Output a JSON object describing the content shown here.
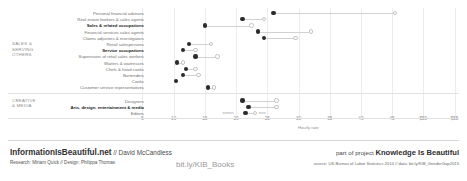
{
  "chart_data": {
    "type": "scatter",
    "subtype": "dumbbell",
    "title": "",
    "xlabel": "Hourly rate",
    "ylabel": "",
    "xlim": [
      3,
      57
    ],
    "grid": true,
    "legend_position": "inline",
    "series": [
      {
        "name": "women",
        "color": "#2b2b2b"
      },
      {
        "name": "men",
        "color": "#ffffff"
      }
    ],
    "tick_labels": [
      "5",
      "10",
      "15",
      "20",
      "25",
      "30",
      "35",
      "40",
      "45",
      "$50",
      "$55"
    ],
    "tick_values": [
      5,
      10,
      15,
      20,
      25,
      30,
      35,
      40,
      45,
      50,
      55
    ],
    "groups": [
      {
        "name": "SALES &\nSERVING\nOTHERS",
        "rows": [
          {
            "label": "Personal financial advisors",
            "bold": false,
            "women": 26.0,
            "men": 45.5
          },
          {
            "label": "Real estate brokers & sales agents",
            "bold": false,
            "women": 21.0,
            "men": 24.5
          },
          {
            "label": "Sales & related occupations",
            "bold": true,
            "women": 15.0,
            "men": 22.5
          },
          {
            "label": "Financial services sales agents",
            "bold": false,
            "women": 23.5,
            "men": 32.0
          },
          {
            "label": "Claims adjusters & investigators",
            "bold": false,
            "women": 24.5,
            "men": 29.5
          },
          {
            "label": "Retail salespersons",
            "bold": false,
            "women": 12.5,
            "men": 16.0
          },
          {
            "label": "Service occupations",
            "bold": true,
            "women": 11.5,
            "men": 13.5
          },
          {
            "label": "Supervisors of retail sales workers",
            "bold": false,
            "women": 13.5,
            "men": 17.0
          },
          {
            "label": "Waiters & waitresses",
            "bold": false,
            "women": 10.5,
            "men": 11.5
          },
          {
            "label": "Chefs & head cooks",
            "bold": false,
            "women": 12.0,
            "men": 13.5
          },
          {
            "label": "Bartenders",
            "bold": false,
            "women": 11.5,
            "men": 14.0
          },
          {
            "label": "Cooks",
            "bold": false,
            "women": 10.4,
            "men": 10.4
          },
          {
            "label": "Customer service representatives",
            "bold": false,
            "women": 15.5,
            "men": 16.5
          }
        ]
      },
      {
        "name": "CREATIVE\n& MEDIA",
        "rows": [
          {
            "label": "Designers",
            "bold": false,
            "women": 21.0,
            "men": 26.5
          },
          {
            "label": "Arts, design, entertainment & media",
            "bold": true,
            "women": 22.0,
            "men": 26.5
          },
          {
            "label": "Editors",
            "bold": false,
            "women": 21.5,
            "men": 23.0
          }
        ]
      }
    ],
    "inline_legend": {
      "women": "women",
      "men": "men"
    }
  },
  "footer": {
    "brand_name": "InformationIsBeautiful.net",
    "brand_sep": " // ",
    "brand_author": "David McCandless",
    "credit": "Research: Miriam Quick // Design: Philippa Thomas",
    "middle_link": "bit.ly/KIB_Books",
    "project_prefix": "part of project ",
    "project_name": "Knowledge Is Beautiful",
    "source": "source: US Bureau of Labor Statistics 2014 // data: bit.ly/KIB_GenderGap2015"
  }
}
